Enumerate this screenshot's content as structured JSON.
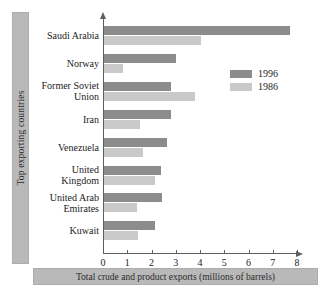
{
  "chart_data": {
    "type": "bar",
    "orientation": "horizontal",
    "title": "",
    "xlabel": "Total crude and product exports (millions of barrels)",
    "ylabel": "Top exporting countries",
    "xlim": [
      0,
      8
    ],
    "xticks": [
      "0",
      "1",
      "2",
      "3",
      "4",
      "5",
      "6",
      "7",
      "8"
    ],
    "grid": false,
    "legend_position": "upper-right",
    "categories": [
      "Saudi Arabia",
      "Norway",
      "Former Soviet Union",
      "Iran",
      "Venezuela",
      "United Kingdom",
      "United Arab Emirates",
      "Kuwait"
    ],
    "category_lines": [
      [
        "Saudi Arabia"
      ],
      [
        "Norway"
      ],
      [
        "Former Soviet",
        "Union"
      ],
      [
        "Iran"
      ],
      [
        "Venezuela"
      ],
      [
        "United",
        "Kingdom"
      ],
      [
        "United Arab",
        "Emirates"
      ],
      [
        "Kuwait"
      ]
    ],
    "series": [
      {
        "name": "1996",
        "color": "#8c8c8c",
        "values": [
          7.65,
          2.95,
          2.75,
          2.75,
          2.6,
          2.35,
          2.4,
          2.1
        ]
      },
      {
        "name": "1986",
        "color": "#c9c9c9",
        "values": [
          4.0,
          0.78,
          3.75,
          1.5,
          1.6,
          2.1,
          1.35,
          1.4
        ]
      }
    ]
  },
  "legend": {
    "entries": [
      {
        "label": "1996"
      },
      {
        "label": "1986"
      }
    ]
  },
  "axes": {
    "x_title": "Total crude and product exports (millions of barrels)",
    "y_title": "Top exporting countries"
  },
  "colors": {
    "series_1996": "#8c8c8c",
    "series_1986": "#c9c9c9",
    "band": "#b9b9b9",
    "axis": "#5e5e5e"
  }
}
